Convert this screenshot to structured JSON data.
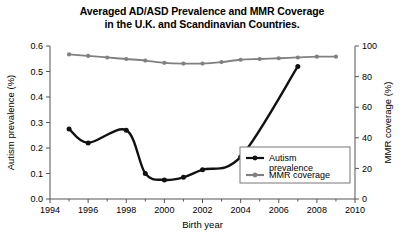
{
  "chart_data": {
    "type": "line",
    "title": "Averaged AD/ASD Prevalence and MMR Coverage in the U.K. and Scandinavian Countries.",
    "title_line1": "Averaged AD/ASD Prevalence and MMR Coverage",
    "title_line2": "in the U.K. and Scandinavian Countries.",
    "xlabel": "Birth year",
    "ylabel": "Autism prevalence (%)",
    "y2label": "MMR coverage (%)",
    "xlim": [
      1994,
      2010
    ],
    "ylim": [
      0.0,
      0.6
    ],
    "y2lim": [
      0,
      100
    ],
    "xticks": [
      1994,
      1996,
      1998,
      2000,
      2002,
      2004,
      2006,
      2008,
      2010
    ],
    "xtick_labels": [
      "1994",
      "1996",
      "1998",
      "2000",
      "2002",
      "2004",
      "2006",
      "2008",
      "2010"
    ],
    "xminor_step": 1,
    "yticks": [
      0.0,
      0.1,
      0.2,
      0.3,
      0.4,
      0.5,
      0.6
    ],
    "ytick_labels": [
      "0.0",
      "0.1",
      "0.2",
      "0.3",
      "0.4",
      "0.5",
      "0.6"
    ],
    "y2ticks": [
      0,
      20,
      40,
      60,
      80,
      100
    ],
    "y2tick_labels": [
      "0",
      "20",
      "40",
      "60",
      "80",
      "100"
    ],
    "grid": false,
    "legend_position": "lower right",
    "series": [
      {
        "name": "Autism prevalence",
        "axis": "left",
        "color": "#111111",
        "marker": "circle",
        "x": [
          1995,
          1996,
          1998,
          1999,
          2000,
          2001,
          2002,
          2004,
          2007
        ],
        "values": [
          0.275,
          0.22,
          0.27,
          0.1,
          0.075,
          0.085,
          0.115,
          0.165,
          0.52
        ]
      },
      {
        "name": "MMR coverage",
        "axis": "right",
        "color": "#808080",
        "marker": "circle",
        "x": [
          1995,
          1996,
          1997,
          1998,
          1999,
          2000,
          2001,
          2002,
          2003,
          2004,
          2005,
          2006,
          2007,
          2008,
          2009
        ],
        "values": [
          94.5,
          93.5,
          92.5,
          91.5,
          90.5,
          89.0,
          88.5,
          88.5,
          89.5,
          91.0,
          91.5,
          92.0,
          92.5,
          93.0,
          93.0
        ]
      }
    ]
  },
  "legend": {
    "items": [
      {
        "label_line1": "Autism",
        "label_line2": "prevalence",
        "color": "#111111"
      },
      {
        "label_line1": "MMR coverage",
        "label_line2": "",
        "color": "#808080"
      }
    ]
  }
}
